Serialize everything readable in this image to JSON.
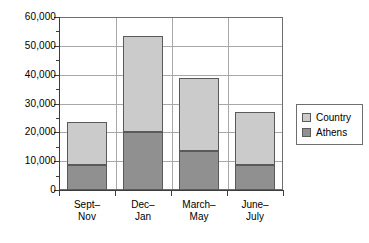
{
  "chart_data": {
    "type": "bar",
    "stacked": true,
    "title": "",
    "xlabel": "",
    "ylabel": "",
    "categories": [
      "Sept–Nov",
      "Dec–Jan",
      "March–May",
      "June–July"
    ],
    "category_lines": [
      [
        "Sept–",
        "Nov"
      ],
      [
        "Dec–",
        "Jan"
      ],
      [
        "March–",
        "May"
      ],
      [
        "June–",
        "July"
      ]
    ],
    "series": [
      {
        "name": "Athens",
        "values": [
          8600,
          20200,
          13500,
          8600
        ],
        "color": "#909090"
      },
      {
        "name": "Country",
        "values": [
          14900,
          33300,
          25200,
          18600
        ],
        "color": "#cbcbcb"
      }
    ],
    "totals": [
      23500,
      53500,
      38700,
      27200
    ],
    "ylim": [
      0,
      60000
    ],
    "ytick_values": [
      0,
      10000,
      20000,
      30000,
      40000,
      50000,
      60000
    ],
    "ytick_labels": [
      "0",
      "10,000",
      "20,000",
      "30,000",
      "40,000",
      "50,000",
      "60,000"
    ],
    "yminor_values": [
      5000,
      15000,
      25000,
      35000,
      45000,
      55000
    ],
    "grid": {
      "horizontal": true,
      "vertical": true
    },
    "legend": {
      "position": "right",
      "entries": [
        {
          "label": "Country",
          "color": "#cbcbcb"
        },
        {
          "label": "Athens",
          "color": "#909090"
        }
      ]
    }
  }
}
